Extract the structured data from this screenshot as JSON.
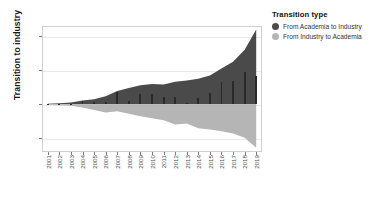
{
  "chart_data": {
    "type": "area",
    "title": "",
    "xlabel": "",
    "ylabel": "Transition to industry",
    "ylim": [
      -280,
      460
    ],
    "xlim": [
      "2001",
      "2019"
    ],
    "grid": true,
    "legend_position": "right",
    "categories": [
      "2001",
      "2002",
      "2003",
      "2004",
      "2005",
      "2006",
      "2007",
      "2008",
      "2009",
      "2010",
      "2011",
      "2012",
      "2013",
      "2014",
      "2015",
      "2016",
      "2017",
      "2018",
      "2019"
    ],
    "yticks": [
      "-200",
      "0",
      "200",
      "400"
    ],
    "ytick_values": [
      -200,
      0,
      200,
      400
    ],
    "series": [
      {
        "name": "From Academia to Industry",
        "color": "#4a4a4a",
        "render": "area",
        "values": [
          4,
          6,
          10,
          22,
          30,
          48,
          78,
          96,
          112,
          120,
          116,
          132,
          140,
          150,
          170,
          210,
          250,
          320,
          440
        ]
      },
      {
        "name": "From Industry to Academia",
        "color": "#b5b5b5",
        "render": "area",
        "values": [
          -3,
          -5,
          -8,
          -18,
          -34,
          -48,
          -40,
          -56,
          -70,
          -82,
          -94,
          -118,
          -112,
          -140,
          -148,
          -158,
          -172,
          -196,
          -255
        ]
      },
      {
        "name": "Yearly transitions",
        "color": "#2a2a2a",
        "render": "bar",
        "values": [
          2,
          3,
          4,
          18,
          12,
          14,
          70,
          18,
          62,
          58,
          42,
          44,
          10,
          40,
          68,
          130,
          138,
          190,
          168
        ]
      }
    ]
  },
  "legend": {
    "title": "Transition type",
    "items": [
      {
        "label": "From Academia to Industry",
        "color": "#4a4a4a"
      },
      {
        "label": "From Industry to Academia",
        "color": "#b5b5b5"
      }
    ]
  }
}
